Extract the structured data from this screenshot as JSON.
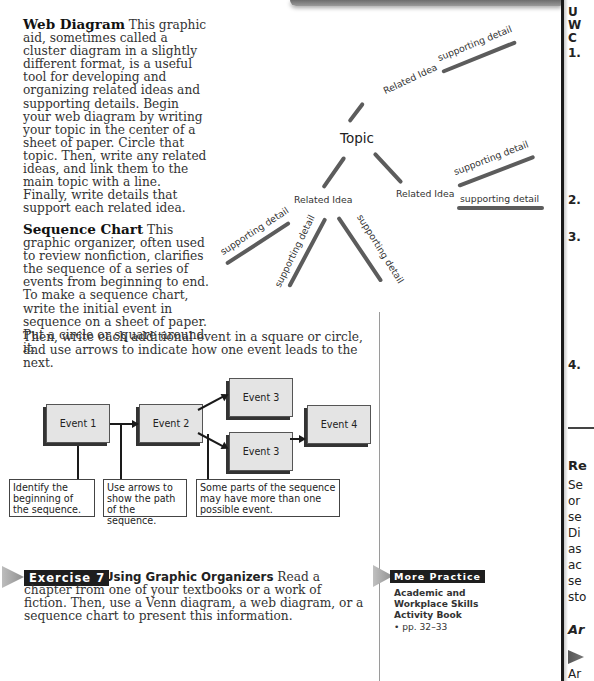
{
  "web_diagram": {
    "heading": "Web Diagram",
    "body": "This graphic aid, sometimes called a cluster diagram in a slightly different format, is a useful tool for developing and organizing related ideas and supporting details. Begin your web diagram by writing your topic in the center of a sheet of paper. Circle that topic. Then, write any related ideas, and link them to the main topic with a line. Finally, write details that support each related idea.",
    "figure": {
      "topic": "Topic",
      "related_idea_label": "Related Idea",
      "supporting_detail_label": "supporting detail"
    }
  },
  "sequence_chart": {
    "heading": "Sequence Chart",
    "body": "This graphic organizer, often used to review nonfiction, clarifies the sequence of a series of events from beginning to end. To make a sequence chart, write the initial event in sequence on a sheet of paper. Put a circle or square around it.",
    "body_tail": "Then, write each additional event in a square or circle, and use arrows to indicate how one event leads to the next.",
    "figure": {
      "events": [
        "Event 1",
        "Event 2",
        "Event 3",
        "Event 3",
        "Event 4"
      ],
      "notes": [
        "Identify the beginning of the sequence.",
        "Use arrows to show the path of the sequence.",
        "Some parts of the sequence may have more than one possible event."
      ]
    }
  },
  "exercise": {
    "label": "Exercise 7",
    "title": "Using Graphic Organizers",
    "body": "Read a chapter from one of your textbooks or a work of fiction. Then, use a Venn diagram, a web diagram, or a sequence chart to present this information."
  },
  "more_practice": {
    "label": "More Practice",
    "title_lines": [
      "Academic and",
      "Workplace Skills",
      "Activity Book"
    ],
    "pages": "• pp. 32–33"
  },
  "right_column_fragment": {
    "heading_lines": [
      "U",
      "W",
      "C"
    ],
    "numbers": [
      "1.",
      "2.",
      "3.",
      "4."
    ],
    "section_heading": "Re",
    "section_lines": [
      "Se",
      "or",
      "se",
      "Di",
      "as",
      "ac",
      "se",
      "sto"
    ],
    "italic_heading": "Ar",
    "last_line": "Ar"
  }
}
